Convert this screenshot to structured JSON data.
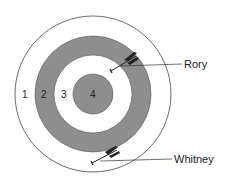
{
  "diagram": {
    "type": "archery-target",
    "colors": {
      "ring_white": "#ffffff",
      "ring_gray": "#8e8e8e",
      "stroke": "#444444",
      "arrow": "#222222"
    },
    "rings": [
      {
        "score": "1",
        "fill": "white"
      },
      {
        "score": "2",
        "fill": "gray"
      },
      {
        "score": "3",
        "fill": "white"
      },
      {
        "score": "4",
        "fill": "gray"
      }
    ],
    "arrows": [
      {
        "label": "Rory",
        "landed_ring": "3"
      },
      {
        "label": "Whitney",
        "landed_ring": "1"
      }
    ]
  }
}
